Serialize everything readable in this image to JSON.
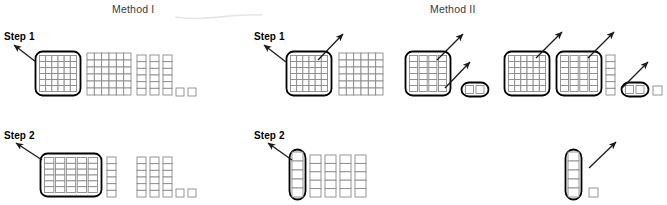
{
  "figure": {
    "title_left": "Method I",
    "title_right": "Method II",
    "step1_label": "Step 1",
    "step2_label": "Step 2",
    "colors": {
      "ink": "#1a1a1a",
      "cell_stroke": "#8a8a8a",
      "group_stroke": "#000000",
      "background": "#ffffff",
      "title_gray": "#3a3a3a"
    }
  },
  "headers": [
    {
      "name": "method-1-title",
      "text": "Method I",
      "x": 112,
      "y": 3
    },
    {
      "name": "method-2-title",
      "text": "Method II",
      "x": 430,
      "y": 3
    }
  ],
  "step_labels": [
    {
      "name": "method-1-step-1",
      "text": "Step 1",
      "x": 4,
      "y": 31
    },
    {
      "name": "method-1-step-2",
      "text": "Step 2",
      "x": 4,
      "y": 130
    },
    {
      "name": "method-2-step-1",
      "text": "Step 1",
      "x": 254,
      "y": 31
    },
    {
      "name": "method-2-step-2",
      "text": "Step 2",
      "x": 254,
      "y": 130
    }
  ],
  "arrows": [
    {
      "name": "arrow-m1-s1",
      "x1": 36,
      "y1": 62,
      "x2": 14,
      "y2": 45
    },
    {
      "name": "arrow-m1-s2",
      "x1": 42,
      "y1": 160,
      "x2": 16,
      "y2": 143
    },
    {
      "name": "arrow-m2-s1",
      "x1": 286,
      "y1": 62,
      "x2": 264,
      "y2": 45
    },
    {
      "name": "arrow-m2-s2",
      "x1": 292,
      "y1": 160,
      "x2": 268,
      "y2": 143
    },
    {
      "name": "arrow-m2-block1-callout",
      "x1": 318,
      "y1": 60,
      "x2": 343,
      "y2": 34
    },
    {
      "name": "arrow-m2-block3-callout",
      "x1": 437,
      "y1": 60,
      "x2": 463,
      "y2": 34
    },
    {
      "name": "arrow-m2-pair-callout",
      "x1": 445,
      "y1": 88,
      "x2": 470,
      "y2": 62
    },
    {
      "name": "arrow-m2b-block1-callout",
      "x1": 536,
      "y1": 58,
      "x2": 562,
      "y2": 32
    },
    {
      "name": "arrow-m2b-block2-callout",
      "x1": 588,
      "y1": 58,
      "x2": 614,
      "y2": 32
    },
    {
      "name": "arrow-m2b-pair-callout",
      "x1": 622,
      "y1": 88,
      "x2": 648,
      "y2": 62
    },
    {
      "name": "arrow-m2b-rod-callout",
      "x1": 589,
      "y1": 168,
      "x2": 616,
      "y2": 142
    }
  ],
  "groups": [
    {
      "name": "m1-s1-flat-circled",
      "kind": "flat-grid",
      "x": 35,
      "y": 51,
      "w": 46,
      "h": 45,
      "cols": 6,
      "rows": 6,
      "circled": true
    },
    {
      "name": "m1-s1-flat-plain",
      "kind": "flat-grid",
      "x": 87,
      "y": 53,
      "w": 44,
      "h": 42,
      "cols": 6,
      "rows": 6,
      "circled": false
    },
    {
      "name": "m1-s1-rod-a",
      "kind": "rod",
      "x": 137,
      "y": 55,
      "w": 9,
      "h": 40,
      "cells": 6,
      "circled": false
    },
    {
      "name": "m1-s1-rod-b",
      "kind": "rod",
      "x": 150,
      "y": 55,
      "w": 9,
      "h": 40,
      "cells": 6,
      "circled": false
    },
    {
      "name": "m1-s1-rod-c",
      "kind": "rod",
      "x": 163,
      "y": 55,
      "w": 9,
      "h": 40,
      "cells": 6,
      "circled": false
    },
    {
      "name": "m1-s1-unit-a",
      "kind": "unit",
      "x": 176,
      "y": 88,
      "w": 8,
      "h": 8,
      "circled": false
    },
    {
      "name": "m1-s1-unit-b",
      "kind": "unit",
      "x": 188,
      "y": 88,
      "w": 8,
      "h": 8,
      "circled": false
    },
    {
      "name": "m1-s2-rodgroup-circled",
      "kind": "rod-cluster",
      "x": 40,
      "y": 153,
      "w": 62,
      "h": 44,
      "count": 5,
      "cells": 6,
      "circled": true
    },
    {
      "name": "m1-s2-rod-extra",
      "kind": "rod",
      "x": 107,
      "y": 157,
      "w": 9,
      "h": 40,
      "cells": 6,
      "circled": false
    },
    {
      "name": "m1-s2-rod-a",
      "kind": "rod",
      "x": 137,
      "y": 157,
      "w": 9,
      "h": 40,
      "cells": 6,
      "circled": false
    },
    {
      "name": "m1-s2-rod-b",
      "kind": "rod",
      "x": 150,
      "y": 157,
      "w": 9,
      "h": 40,
      "cells": 6,
      "circled": false
    },
    {
      "name": "m1-s2-rod-c",
      "kind": "rod",
      "x": 163,
      "y": 157,
      "w": 9,
      "h": 40,
      "cells": 6,
      "circled": false
    },
    {
      "name": "m1-s2-unit-a",
      "kind": "unit",
      "x": 176,
      "y": 189,
      "w": 8,
      "h": 8,
      "circled": false
    },
    {
      "name": "m1-s2-unit-b",
      "kind": "unit",
      "x": 188,
      "y": 189,
      "w": 8,
      "h": 8,
      "circled": false
    },
    {
      "name": "m2-s1-flat-circled",
      "kind": "flat-grid",
      "x": 286,
      "y": 51,
      "w": 46,
      "h": 45,
      "cols": 6,
      "rows": 6,
      "circled": true
    },
    {
      "name": "m2-s1-flat-plain",
      "kind": "flat-grid",
      "x": 339,
      "y": 53,
      "w": 44,
      "h": 42,
      "cols": 6,
      "rows": 6,
      "circled": false
    },
    {
      "name": "m2-s1-rodflat-circled",
      "kind": "rod-cluster",
      "x": 405,
      "y": 51,
      "w": 46,
      "h": 45,
      "count": 4,
      "cells": 6,
      "circled": true
    },
    {
      "name": "m2-s1-pair-circled",
      "kind": "unit-pair",
      "x": 461,
      "y": 82,
      "w": 28,
      "h": 15,
      "count": 2,
      "circled": true
    },
    {
      "name": "m2b-s1-flat-circled",
      "kind": "flat-grid",
      "x": 504,
      "y": 51,
      "w": 46,
      "h": 45,
      "cols": 6,
      "rows": 6,
      "circled": true
    },
    {
      "name": "m2b-s1-rodflat-circled",
      "kind": "rod-cluster",
      "x": 556,
      "y": 51,
      "w": 46,
      "h": 45,
      "count": 4,
      "cells": 6,
      "circled": true
    },
    {
      "name": "m2b-s1-rod-extra",
      "kind": "rod",
      "x": 606,
      "y": 55,
      "w": 9,
      "h": 40,
      "cells": 6,
      "circled": false
    },
    {
      "name": "m2b-s1-pair-circled",
      "kind": "unit-pair",
      "x": 621,
      "y": 82,
      "w": 28,
      "h": 15,
      "count": 2,
      "circled": true
    },
    {
      "name": "m2b-s1-unit-loose",
      "kind": "unit",
      "x": 653,
      "y": 86,
      "w": 9,
      "h": 9,
      "circled": false
    },
    {
      "name": "m2-s2-rod-circled",
      "kind": "rod",
      "x": 292,
      "y": 152,
      "w": 11,
      "h": 45,
      "cells": 5,
      "circled": true
    },
    {
      "name": "m2-s2-rod-a",
      "kind": "rod",
      "x": 310,
      "y": 155,
      "w": 11,
      "h": 42,
      "cells": 5,
      "circled": false
    },
    {
      "name": "m2-s2-rod-b",
      "kind": "rod",
      "x": 325,
      "y": 155,
      "w": 11,
      "h": 42,
      "cells": 5,
      "circled": false
    },
    {
      "name": "m2-s2-rod-c",
      "kind": "rod",
      "x": 340,
      "y": 155,
      "w": 11,
      "h": 42,
      "cells": 5,
      "circled": false
    },
    {
      "name": "m2-s2-rod-d",
      "kind": "rod",
      "x": 355,
      "y": 155,
      "w": 11,
      "h": 42,
      "cells": 5,
      "circled": false
    },
    {
      "name": "m2b-s2-rod-circled",
      "kind": "rod",
      "x": 568,
      "y": 152,
      "w": 11,
      "h": 45,
      "cells": 5,
      "circled": true
    },
    {
      "name": "m2b-s2-unit-loose",
      "kind": "unit",
      "x": 589,
      "y": 188,
      "w": 9,
      "h": 9,
      "circled": false
    }
  ],
  "artifact": {
    "name": "scan-smudge-curve",
    "path": "M 176 17 C 205 22, 232 13, 262 15"
  }
}
